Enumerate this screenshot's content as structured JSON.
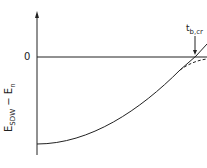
{
  "diagram": {
    "zero_label": "0",
    "y_axis_label": {
      "main": "E",
      "sub1": "SDW",
      "dash": " − ",
      "main2": "E",
      "sub2": "n"
    },
    "critical_label": {
      "main": "t",
      "sub": "b,cr"
    },
    "colors": {
      "line": "#222222",
      "background": "#ffffff"
    }
  }
}
